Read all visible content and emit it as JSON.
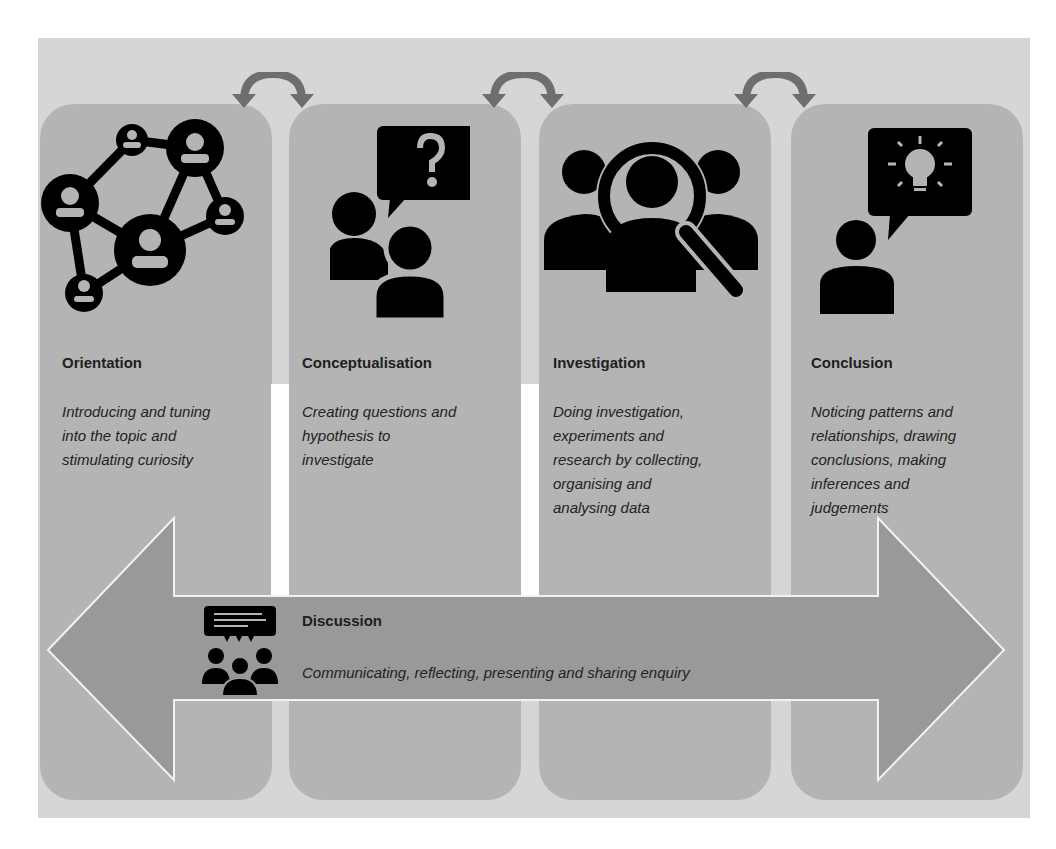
{
  "diagram": {
    "stages": [
      {
        "title": "Orientation",
        "description_lines": [
          "Introducing and tuning",
          "into the topic and",
          "stimulating curiosity"
        ],
        "icon": "network-people-icon"
      },
      {
        "title": "Conceptualisation",
        "description_lines": [
          "Creating questions and",
          "hypothesis to",
          "investigate"
        ],
        "icon": "people-question-icon"
      },
      {
        "title": "Investigation",
        "description_lines": [
          "Doing investigation,",
          "experiments and",
          "research by collecting,",
          "organising and",
          "analysing data"
        ],
        "icon": "people-magnifier-icon"
      },
      {
        "title": "Conclusion",
        "description_lines": [
          "Noticing patterns and",
          "relationships, drawing",
          "conclusions, making",
          "inferences and",
          "judgements"
        ],
        "icon": "person-lightbulb-icon"
      }
    ],
    "connectors": [
      "bidirectional-curved-arrow",
      "bidirectional-curved-arrow",
      "bidirectional-curved-arrow"
    ],
    "discussion": {
      "title": "Discussion",
      "description": "Communicating, reflecting, presenting and sharing enquiry",
      "icon": "discussion-group-icon"
    },
    "colors": {
      "panel": "#d6d6d6",
      "column": "#b4b4b4",
      "band": "#999999",
      "arc": "#6e6e6e",
      "icon": "#000000"
    }
  }
}
